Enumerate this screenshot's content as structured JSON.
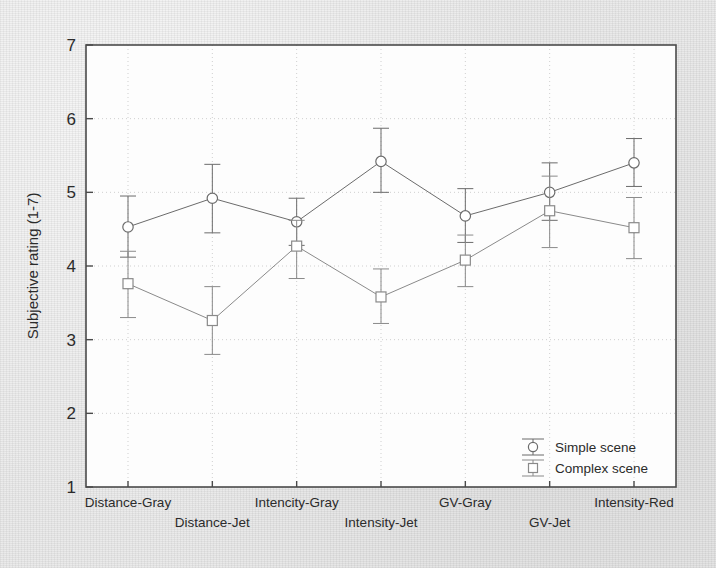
{
  "chart_data": {
    "type": "line",
    "title": "",
    "subtitle": "",
    "xlabel": "",
    "ylabel": "Subjective rating (1-7)",
    "ylim": [
      1,
      7
    ],
    "yticks": [
      1,
      2,
      3,
      4,
      5,
      6,
      7
    ],
    "ytick_labels": [
      "1",
      "2",
      "3",
      "4",
      "5",
      "6",
      "7"
    ],
    "grid": true,
    "grid_style": "dotted light gray",
    "legend_position": "bottom-right inside plot",
    "error_bars": true,
    "error_bar_meaning": "vertical whisker with caps",
    "categories": [
      "Distance-Gray",
      "Distance-Jet",
      "Intencity-Gray",
      "Intensity-Jet",
      "GV-Gray",
      "GV-Jet",
      "Intensity-Red"
    ],
    "category_label_rows": [
      0,
      1,
      0,
      1,
      0,
      1,
      0
    ],
    "series": [
      {
        "name": "Simple scene",
        "marker": "circle",
        "values": [
          4.53,
          4.92,
          4.6,
          5.42,
          4.68,
          5.0,
          5.4
        ],
        "err_low": [
          4.12,
          4.45,
          4.28,
          5.0,
          4.32,
          4.62,
          5.08
        ],
        "err_high": [
          4.95,
          5.38,
          4.92,
          5.87,
          5.05,
          5.4,
          5.73
        ]
      },
      {
        "name": "Complex scene",
        "marker": "square",
        "values": [
          3.76,
          3.26,
          4.27,
          3.58,
          4.08,
          4.75,
          4.52
        ],
        "err_low": [
          3.3,
          2.8,
          3.83,
          3.22,
          3.72,
          4.25,
          4.1
        ],
        "err_high": [
          4.2,
          3.72,
          4.62,
          3.96,
          4.42,
          5.22,
          4.93
        ]
      }
    ],
    "colors": {
      "axis": "#4a4a4a",
      "grid": "#cfcfcf",
      "series_simple": "#6b6b6b",
      "series_complex": "#8a8a8a",
      "text": "#2b2b2b",
      "plot_background": "#fdfdfd",
      "page_background": "#e7e7e7"
    }
  },
  "legend": {
    "entries": [
      {
        "label": "Simple scene",
        "marker": "circle"
      },
      {
        "label": "Complex scene",
        "marker": "square"
      }
    ]
  }
}
